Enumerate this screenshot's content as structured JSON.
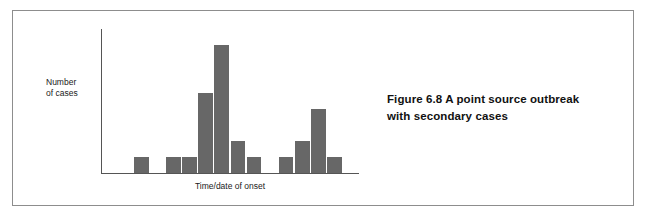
{
  "figure": {
    "caption_line_1": "Figure 6.8  A point source outbreak",
    "caption_line_2": "with secondary cases",
    "frame_color": "#8d8d8d",
    "background_color": "#ffffff"
  },
  "chart_data": {
    "type": "bar",
    "title": "",
    "subtitle": "",
    "xlabel": "Time/date of onset",
    "ylabel": "Number\nof cases",
    "ylabel_line_1": "Number",
    "ylabel_line_2": "of cases",
    "grid": false,
    "legend": false,
    "legend_position": "none",
    "bar_color": "#676767",
    "axis_color": "#555555",
    "categories": [
      "1",
      "2",
      "3",
      "4",
      "5",
      "6",
      "7",
      "8",
      "9",
      "10",
      "11",
      "12",
      "13",
      "14",
      "15",
      "16"
    ],
    "values": [
      0,
      0,
      1,
      0,
      1,
      1,
      5,
      8,
      2,
      1,
      0,
      1,
      2,
      4,
      1,
      0
    ],
    "ylim": [
      0,
      9
    ],
    "xlim": [
      0,
      16
    ],
    "annotations": []
  }
}
